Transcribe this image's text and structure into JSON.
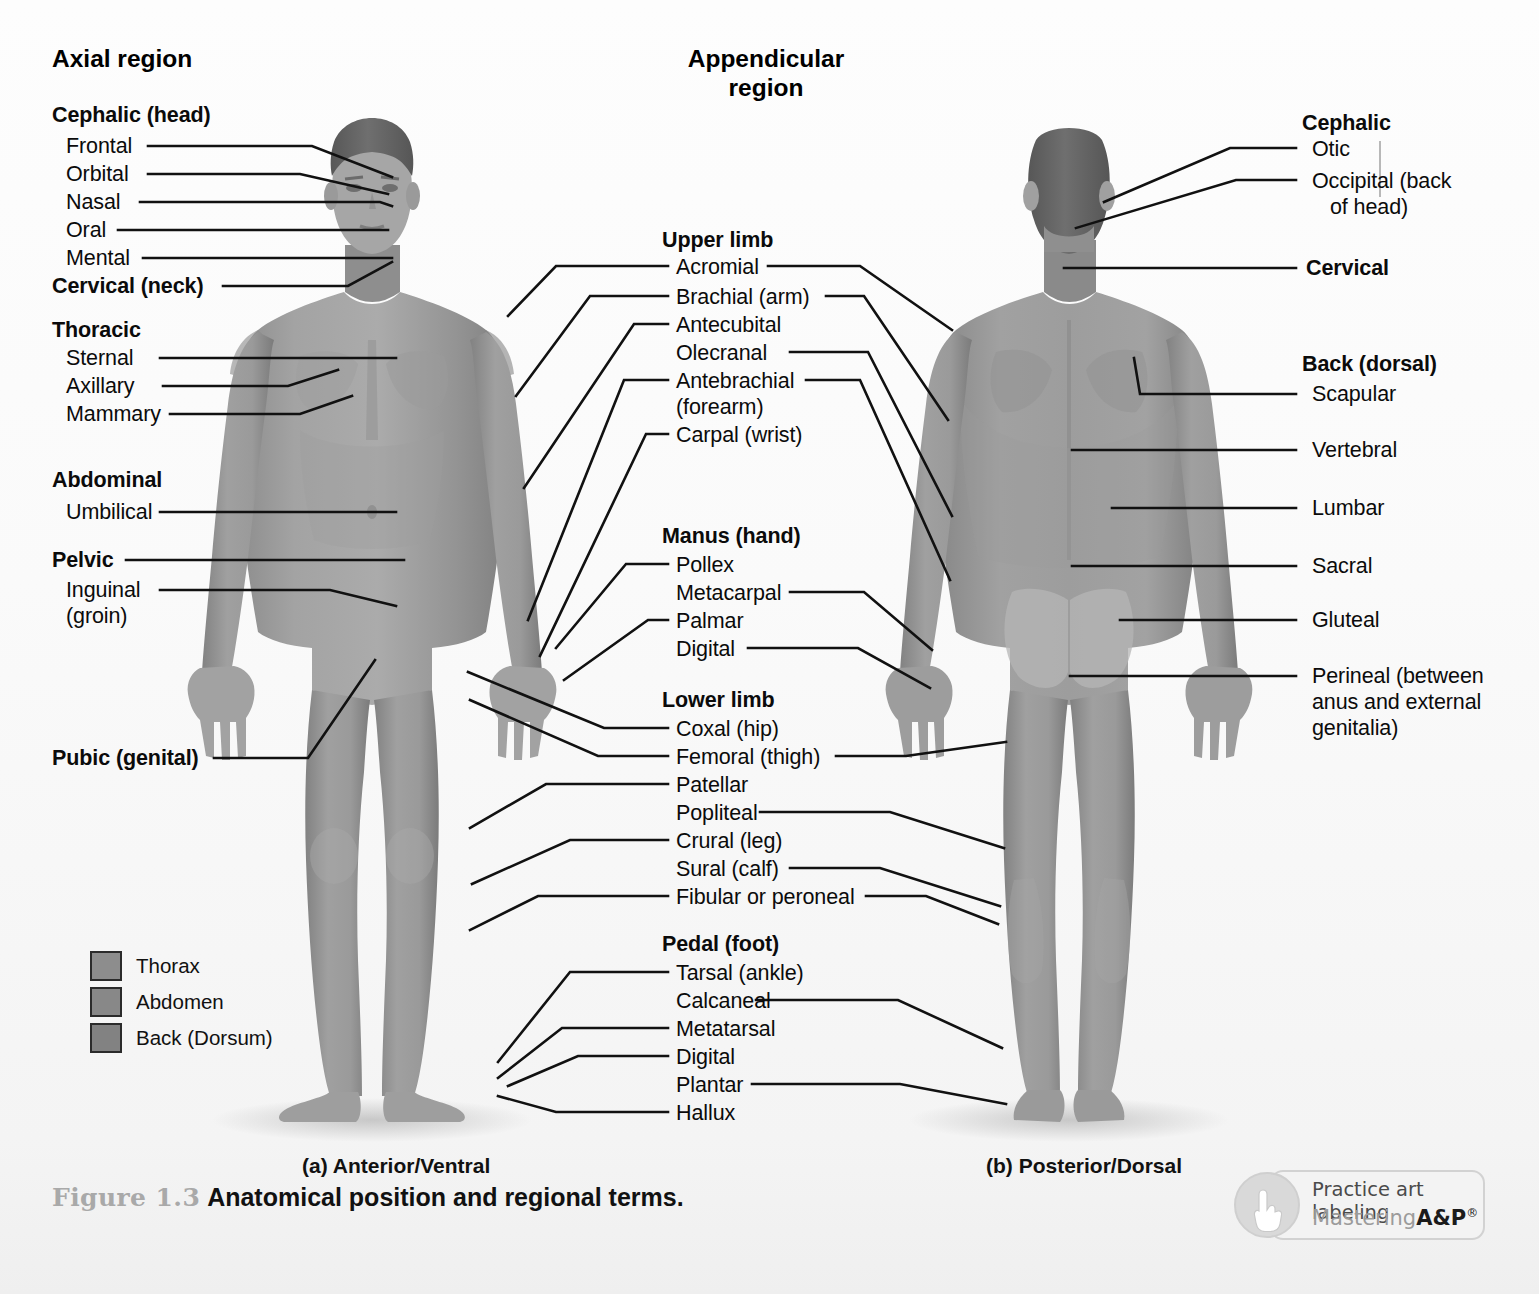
{
  "headings": {
    "axial": "Axial region",
    "appendicular_line1": "Appendicular",
    "appendicular_line2": "region"
  },
  "left_column": {
    "groups": [
      {
        "title": "Cephalic (head)",
        "items": [
          "Frontal",
          "Orbital",
          "Nasal",
          "Oral",
          "Mental"
        ]
      },
      {
        "title": "Cervical (neck)",
        "items": []
      },
      {
        "title": "Thoracic",
        "items": [
          "Sternal",
          "Axillary",
          "Mammary"
        ]
      },
      {
        "title": "Abdominal",
        "items": [
          "Umbilical"
        ]
      },
      {
        "title": "Pelvic",
        "items": [
          "Inguinal",
          "(groin)"
        ]
      },
      {
        "title": "Pubic (genital)",
        "items": []
      }
    ],
    "labels": {
      "cephalic": "Cephalic (head)",
      "frontal": "Frontal",
      "orbital": "Orbital",
      "nasal": "Nasal",
      "oral": "Oral",
      "mental": "Mental",
      "cervical_neck": "Cervical (neck)",
      "thoracic": "Thoracic",
      "sternal": "Sternal",
      "axillary": "Axillary",
      "mammary": "Mammary",
      "abdominal": "Abdominal",
      "umbilical": "Umbilical",
      "pelvic": "Pelvic",
      "inguinal": "Inguinal",
      "inguinal_2": "(groin)",
      "pubic": "Pubic (genital)"
    }
  },
  "center_column": {
    "labels": {
      "upper_limb": "Upper limb",
      "acromial": "Acromial",
      "brachial": "Brachial (arm)",
      "antecubital": "Antecubital",
      "olecranal": "Olecranal",
      "antebrachial": "Antebrachial",
      "antebrachial_2": "(forearm)",
      "carpal": "Carpal (wrist)",
      "manus": "Manus (hand)",
      "pollex": "Pollex",
      "metacarpal": "Metacarpal",
      "palmar": "Palmar",
      "digital_hand": "Digital",
      "lower_limb": "Lower limb",
      "coxal": "Coxal (hip)",
      "femoral": "Femoral (thigh)",
      "patellar": "Patellar",
      "popliteal": "Popliteal",
      "crural": "Crural (leg)",
      "sural": "Sural (calf)",
      "fibular": "Fibular or peroneal",
      "pedal": "Pedal (foot)",
      "tarsal": "Tarsal (ankle)",
      "calcaneal": "Calcaneal",
      "metatarsal": "Metatarsal",
      "digital_foot": "Digital",
      "plantar": "Plantar",
      "hallux": "Hallux"
    }
  },
  "right_column": {
    "labels": {
      "cephalic": "Cephalic",
      "otic": "Otic",
      "occipital": "Occipital (back",
      "occipital_2": "of head)",
      "cervical": "Cervical",
      "back_dorsal": "Back (dorsal)",
      "scapular": "Scapular",
      "vertebral": "Vertebral",
      "lumbar": "Lumbar",
      "sacral": "Sacral",
      "gluteal": "Gluteal",
      "perineal": "Perineal (between",
      "perineal_2": "anus and external",
      "perineal_3": "genitalia)"
    }
  },
  "captions": {
    "anterior": "(a) Anterior/Ventral",
    "posterior": "(b) Posterior/Dorsal"
  },
  "figure": {
    "number": "Figure 1.3",
    "title": "Anatomical position and regional terms."
  },
  "legend": {
    "items": [
      {
        "label": "Thorax",
        "color": "#8d8d8d"
      },
      {
        "label": "Abdomen",
        "color": "#888888"
      },
      {
        "label": "Back (Dorsum)",
        "color": "#828282"
      }
    ]
  },
  "badge": {
    "line1": "Practice art labeling",
    "brand_light": "Mastering",
    "brand_bold": "A&P",
    "registered": "®"
  },
  "colors": {
    "skin_base": "#9a9a9a",
    "skin_shade": "#7e7e7e",
    "skin_light": "#b0b0b0",
    "hair": "#6b6b6b",
    "leader": "#111111",
    "page": "#fbfbfb"
  }
}
